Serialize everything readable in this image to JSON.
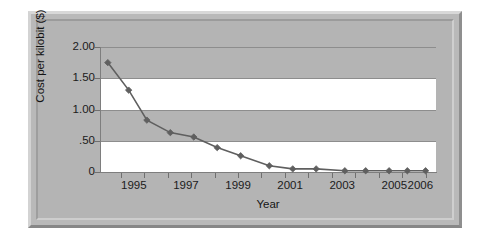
{
  "chart_data": {
    "type": "line",
    "title": "",
    "xlabel": "Year",
    "ylabel": "Cost per kilobit ($)",
    "xlim": [
      1993.7,
      2006.6
    ],
    "ylim": [
      0,
      2.0
    ],
    "grid": true,
    "legend": "none",
    "banded_background": true,
    "marker": "diamond",
    "series_color": "#5f5f5f",
    "x": [
      1994.0,
      1994.8,
      1995.5,
      1996.4,
      1997.3,
      1998.2,
      1999.1,
      2000.2,
      2001.1,
      2002.0,
      2003.1,
      2003.9,
      2004.8,
      2005.5,
      2006.2
    ],
    "values": [
      1.75,
      1.31,
      0.83,
      0.63,
      0.56,
      0.39,
      0.26,
      0.1,
      0.05,
      0.05,
      0.02,
      0.02,
      0.02,
      0.02,
      0.02
    ],
    "ytick_labels": [
      "2.00",
      "1.50",
      "1.00",
      ".50",
      "0"
    ],
    "ytick_values": [
      2.0,
      1.5,
      1.0,
      0.5,
      0.0
    ],
    "xtick_labels": [
      "1995",
      "1997",
      "1999",
      "2001",
      "2003",
      "2005",
      "2006"
    ],
    "xtick_values": [
      1995,
      1997,
      1999,
      2001,
      2003,
      2005,
      2006
    ]
  },
  "axes": {
    "y_title": "Cost per kilobit ($)",
    "x_title": "Year"
  },
  "colors": {
    "frame": "#b9b9b9",
    "plot_band_gray": "#b4b4b4",
    "plot_band_white": "#ffffff",
    "gridline": "#8d8d8d",
    "line": "#5f5f5f",
    "text": "#1b1b1b"
  }
}
